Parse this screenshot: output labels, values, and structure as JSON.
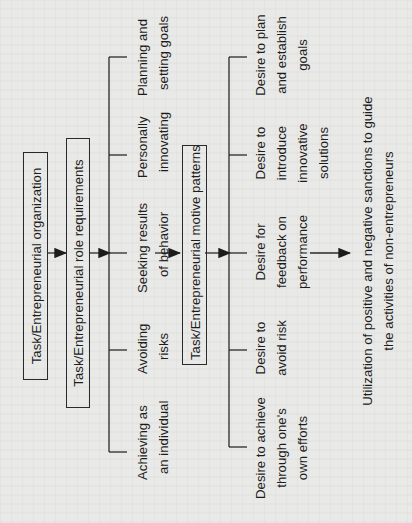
{
  "diagram": {
    "orientation": "rotated-90-ccw",
    "colors": {
      "ink": "#1c1c1c",
      "paper": "#e9e9e7"
    },
    "boxes": [
      {
        "id": "org",
        "label": "Task/Entrepreneurial organization"
      },
      {
        "id": "role",
        "label": "Task/Entrepreneurial role requirements"
      },
      {
        "id": "motive",
        "label": "Task/Entrepreneurial motive patterns"
      }
    ],
    "role_requirements": [
      {
        "line1": "Planning and",
        "line2": "setting goals"
      },
      {
        "line1": "Personally",
        "line2": "innovating"
      },
      {
        "line1": "Seeking results",
        "line2": "of behavior"
      },
      {
        "line1": "Avoiding",
        "line2": "risks"
      },
      {
        "line1": "Achieving as",
        "line2": "an individual"
      }
    ],
    "motive_patterns": [
      {
        "line1": "Desire to plan",
        "line2": "and establish",
        "line3": "goals"
      },
      {
        "line1": "Desire to",
        "line2": "introduce",
        "line3": "innovative",
        "line4": "solutions"
      },
      {
        "line1": "Desire for",
        "line2": "feedback on",
        "line3": "performance"
      },
      {
        "line1": "Desire to",
        "line2": "avoid risk"
      },
      {
        "line1": "Desire to achieve",
        "line2": "through one's",
        "line3": "own efforts"
      }
    ],
    "outcome": {
      "line1": "Utilization of positive and negative sanctions to guide",
      "line2": "the activities of non-entrepreneurs"
    }
  }
}
